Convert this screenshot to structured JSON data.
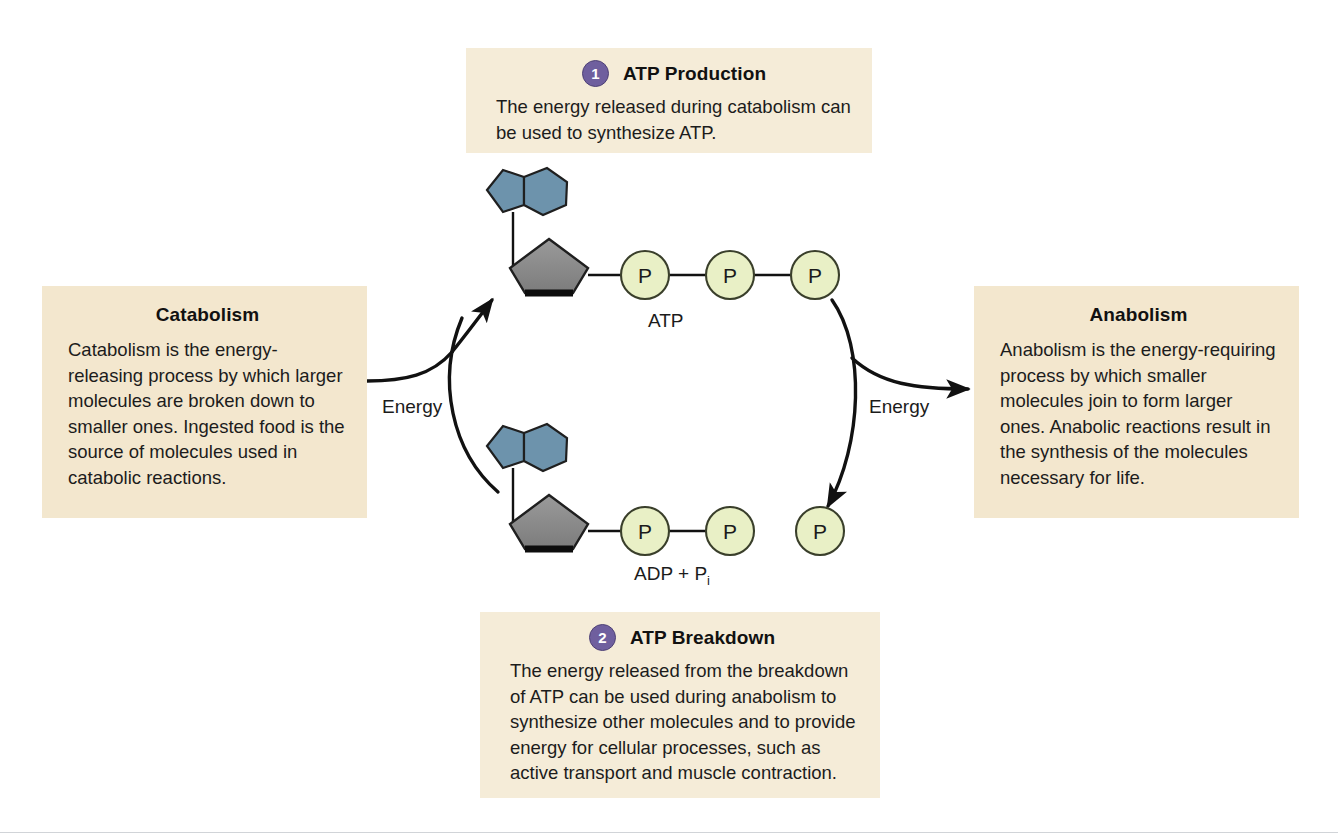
{
  "diagram": {
    "colors": {
      "callout_bg": "#f4e9d2",
      "step_badge": "#6f5f9e",
      "adenine_blue": "#6d93ac",
      "ribose_gray": "#8c8c8c",
      "phosphate_green": "#e9f0c6",
      "stroke": "#111111"
    }
  },
  "steps": [
    {
      "number": "1",
      "title": "ATP Production",
      "body": "The energy released during catabolism can be used to synthesize ATP."
    },
    {
      "number": "2",
      "title": "ATP Breakdown",
      "body": "The energy released from the breakdown of ATP can be used during anabolism to synthesize other molecules and to provide energy for cellular processes, such as active transport and muscle contraction."
    }
  ],
  "side_boxes": [
    {
      "title": "Catabolism",
      "body": "Catabolism is the energy-releasing process by which larger molecules are broken down to smaller ones. Ingested food is the source of molecules used in catabolic reactions."
    },
    {
      "title": "Anabolism",
      "body": "Anabolism is the energy-requiring process by which smaller molecules join to form larger ones. Anabolic reactions result in the synthesis of the molecules necessary for life."
    }
  ],
  "molecules": {
    "atp": {
      "label": "ATP",
      "phosphate_glyph": "P",
      "phosphate_count": 3,
      "bonded_phosphates": 3,
      "free_phosphates": 0
    },
    "adp": {
      "label_main": "ADP + P",
      "label_sub": "i",
      "phosphate_glyph": "P",
      "phosphate_count": 3,
      "bonded_phosphates": 2,
      "free_phosphates": 1
    }
  },
  "arrow_labels": {
    "left": "Energy",
    "right": "Energy"
  }
}
